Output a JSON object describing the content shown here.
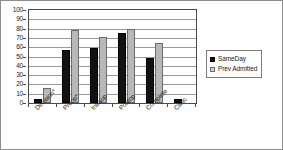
{
  "chart_data": {
    "type": "bar",
    "title": "",
    "subtitle": "",
    "xlabel": "",
    "ylabel": "",
    "ylim": [
      0,
      100
    ],
    "ytick_step": 10,
    "yticks": [
      0,
      10,
      20,
      30,
      40,
      50,
      60,
      70,
      80,
      90,
      100
    ],
    "grid": true,
    "grid_axis": "y",
    "legend_position": "right",
    "categories": [
      "Decision*",
      "Preop*",
      "Intraop",
      "Postop",
      "Complete",
      "Clinic"
    ],
    "series": [
      {
        "name": "SameDay",
        "color": "#121212",
        "values": [
          4,
          57,
          59,
          75,
          48,
          4
        ]
      },
      {
        "name": "Prev Admitted",
        "color": "#b8b8b8",
        "values": [
          16,
          78,
          71,
          80,
          65,
          0
        ]
      }
    ]
  },
  "legend": {
    "items": [
      {
        "label": "SameDay",
        "swatch": "legend-swatch-sameday"
      },
      {
        "label": "Prev Admitted",
        "swatch": "legend-swatch-prev-admitted"
      }
    ]
  },
  "axes": {
    "y": {
      "labels": [
        "100",
        "90",
        "80",
        "70",
        "60",
        "50",
        "40",
        "30",
        "20",
        "10",
        "0"
      ]
    },
    "x": {
      "labels": [
        "Decision*",
        "Preop*",
        "Intraop",
        "Postop",
        "Complete",
        "Clinic"
      ]
    }
  },
  "colors": {
    "sameday": "#121212",
    "prev_admitted": "#b8b8b8",
    "gridline": "#9a9a9a",
    "axis": "#4a4a4a",
    "background": "#ffffff"
  }
}
